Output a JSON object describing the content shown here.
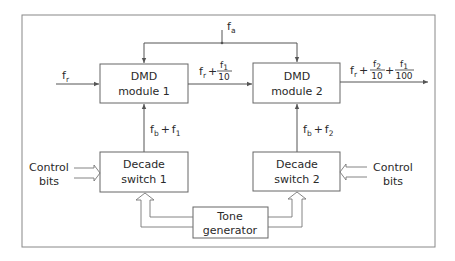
{
  "diagram": {
    "colors": {
      "line": "#555555",
      "text": "#2a2a2a",
      "background": "#ffffff"
    },
    "blocks": {
      "dmd1": {
        "line1": "DMD",
        "line2": "module 1"
      },
      "dmd2": {
        "line1": "DMD",
        "line2": "module 2"
      },
      "ds1": {
        "line1": "Decade",
        "line2": "switch 1"
      },
      "ds2": {
        "line1": "Decade",
        "line2": "switch 2"
      },
      "tone": {
        "line1": "Tone",
        "line2": "generator"
      }
    },
    "signals": {
      "fa": {
        "base": "f",
        "sub": "a"
      },
      "fr": {
        "base": "f",
        "sub": "r"
      },
      "dmd1_out": {
        "base": "f",
        "sub": "r",
        "plus": "+",
        "num_base": "f",
        "num_sub": "1",
        "den": "10"
      },
      "dmd2_out": {
        "base": "f",
        "sub": "r",
        "plus": "+",
        "frac1_num_base": "f",
        "frac1_num_sub": "2",
        "frac1_den": "10",
        "plus2": "+",
        "frac2_num_base": "f",
        "frac2_num_sub": "1",
        "frac2_den": "100"
      },
      "ds1_out": {
        "b": "f",
        "b_sub": "b",
        "plus": "+",
        "f": "f",
        "f_sub": "1"
      },
      "ds2_out": {
        "b": "f",
        "b_sub": "b",
        "plus": "+",
        "f": "f",
        "f_sub": "2"
      }
    },
    "control_left": {
      "line1": "Control",
      "line2": "bits"
    },
    "control_right": {
      "line1": "Control",
      "line2": "bits"
    }
  }
}
